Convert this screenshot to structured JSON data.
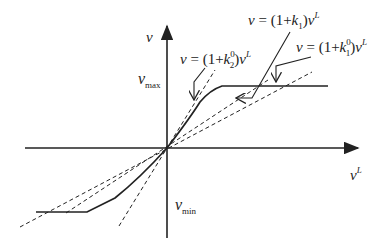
{
  "diagram": {
    "axes": {
      "y_label": "v",
      "x_label": "v",
      "x_label_sup": "L"
    },
    "levels": {
      "vmax_base": "v",
      "vmax_sub": "max",
      "vmin_base": "v",
      "vmin_sub": "min"
    },
    "annotations": [
      {
        "id": "k1",
        "prefix": "v = (1+",
        "k": "k",
        "sub": "1",
        "sup": "",
        "suffix": ")v",
        "suffix_sup": "L"
      },
      {
        "id": "k1_0",
        "prefix": "v = (1+",
        "k": "k",
        "sub": "1",
        "sup": "0",
        "suffix": ")v",
        "suffix_sup": "L"
      },
      {
        "id": "k2_0",
        "prefix": "v = (1+",
        "k": "k",
        "sub": "2",
        "sup": "0",
        "suffix": ")v",
        "suffix_sup": "L"
      }
    ],
    "colors": {
      "line": "#222222",
      "background": "#ffffff"
    }
  }
}
